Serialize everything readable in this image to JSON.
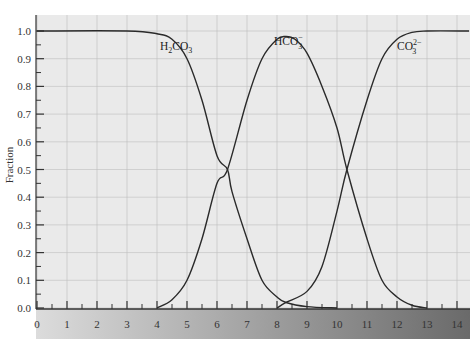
{
  "chart_data": {
    "type": "line",
    "title": "",
    "xlabel": "",
    "ylabel": "Fraction",
    "xlim": [
      0,
      14.4
    ],
    "ylim": [
      0,
      1.0
    ],
    "grid": true,
    "x_ticks": [
      "0",
      "1",
      "2",
      "3",
      "4",
      "5",
      "6",
      "7",
      "8",
      "9",
      "10",
      "11",
      "12",
      "13",
      "14"
    ],
    "y_ticks": [
      "0.0",
      "0.1",
      "0.2",
      "0.3",
      "0.4",
      "0.5",
      "0.6",
      "0.7",
      "0.8",
      "0.9",
      "1.0"
    ],
    "series": [
      {
        "name": "H2CO3",
        "label_main": "H",
        "label_sub1": "2",
        "label_mid": "CO",
        "label_sub2": "3",
        "label_sup": "",
        "x": [
          0,
          3,
          4,
          4.5,
          5,
          5.5,
          6,
          6.35,
          6.5,
          7,
          7.5,
          8,
          8.3,
          9,
          10
        ],
        "y": [
          1.0,
          1.0,
          0.99,
          0.97,
          0.9,
          0.75,
          0.55,
          0.5,
          0.42,
          0.25,
          0.1,
          0.04,
          0.02,
          0.005,
          0.0
        ]
      },
      {
        "name": "HCO3-",
        "label_main": "HCO",
        "label_sub1": "",
        "label_mid": "",
        "label_sub2": "3",
        "label_sup": "−",
        "x": [
          4,
          4.5,
          5,
          5.5,
          6,
          6.35,
          7,
          7.5,
          8,
          8.3,
          8.6,
          9,
          9.5,
          10,
          10.33,
          11,
          11.5,
          12,
          12.5,
          13
        ],
        "y": [
          0.0,
          0.03,
          0.1,
          0.25,
          0.45,
          0.5,
          0.75,
          0.9,
          0.97,
          0.98,
          0.97,
          0.92,
          0.8,
          0.65,
          0.5,
          0.25,
          0.1,
          0.04,
          0.01,
          0.0
        ]
      },
      {
        "name": "CO3 2-",
        "label_main": "CO",
        "label_sub1": "",
        "label_mid": "",
        "label_sub2": "3",
        "label_sup": "2−",
        "x": [
          8,
          8.3,
          9,
          9.5,
          10,
          10.33,
          11,
          11.5,
          12,
          12.5,
          13,
          14.4
        ],
        "y": [
          0.0,
          0.02,
          0.06,
          0.15,
          0.35,
          0.5,
          0.75,
          0.9,
          0.97,
          0.995,
          1.0,
          1.0
        ]
      }
    ],
    "annotations": [
      {
        "text": "H2CO3",
        "x": 4.1,
        "y": 0.93
      },
      {
        "text": "HCO3-",
        "x": 7.9,
        "y": 0.95
      },
      {
        "text": "CO3 2-",
        "x": 12.0,
        "y": 0.93
      }
    ]
  },
  "colors": {
    "plot_bg": "#eaeaea",
    "grid": "#bdbdbd",
    "curve": "#2a2a2a",
    "band_left": "#d9d9d9",
    "band_right": "#6e6e6e"
  }
}
